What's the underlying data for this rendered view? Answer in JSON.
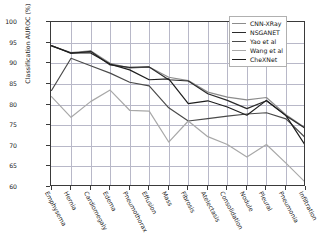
{
  "chart_data": {
    "type": "line",
    "title": "",
    "xlabel": "",
    "ylabel": "Classification AUROC (%)",
    "ylim": [
      60,
      100
    ],
    "yticks": [
      60,
      65,
      70,
      75,
      80,
      85,
      90,
      95,
      100
    ],
    "grid": true,
    "legend_position": "upper right",
    "categories": [
      "Emphysema",
      "Hernia",
      "Cardiomegaly",
      "Edema",
      "Pneumothorax",
      "Effusion",
      "Mass",
      "Fibrosis",
      "Atelectasis",
      "Consolidation",
      "Nodule",
      "Pleural",
      "Pneumonia",
      "Infiltration"
    ],
    "series": [
      {
        "name": "CNN-XRay",
        "color": "#8c8c8c",
        "values": [
          94.2,
          92.6,
          93.0,
          90.0,
          88.8,
          89.1,
          86.6,
          85.8,
          83.0,
          81.8,
          81.1,
          81.7,
          77.5,
          74.3
        ]
      },
      {
        "name": "NSGANET",
        "color": "#2b2b2b",
        "values": [
          94.3,
          92.4,
          92.9,
          89.6,
          89.0,
          89.1,
          86.0,
          85.7,
          82.6,
          81.0,
          79.0,
          80.9,
          77.3,
          74.2
        ]
      },
      {
        "name": "Yao et al",
        "color": "#4a4a4a",
        "values": [
          83.4,
          91.2,
          89.4,
          87.6,
          85.4,
          84.5,
          79.2,
          76.0,
          76.6,
          77.2,
          77.7,
          78.0,
          76.5,
          71.9
        ]
      },
      {
        "name": "Wang et al",
        "color": "#a8a8a8",
        "values": [
          81.9,
          76.9,
          80.7,
          83.5,
          78.6,
          78.4,
          70.9,
          76.0,
          72.2,
          70.3,
          67.3,
          70.3,
          65.8,
          61.1
        ]
      },
      {
        "name": "CheXNet",
        "color": "#1e1e1e",
        "values": [
          94.2,
          92.5,
          92.5,
          89.8,
          88.4,
          86.0,
          86.2,
          80.2,
          80.9,
          79.4,
          77.4,
          81.0,
          77.3,
          70.0
        ]
      }
    ]
  }
}
